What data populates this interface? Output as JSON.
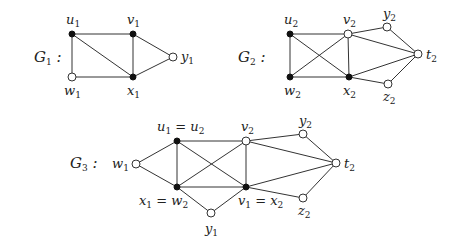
{
  "graphs": [
    {
      "name": "G1",
      "label": {
        "main": "G",
        "sub": "1",
        "suffix": " :",
        "x": 34,
        "y": 62
      },
      "vertices": [
        {
          "id": "u1",
          "x": 72,
          "y": 34,
          "filled": true,
          "label": {
            "main": "u",
            "sub": "1",
            "x": 66,
            "y": 24
          }
        },
        {
          "id": "v1",
          "x": 133,
          "y": 34,
          "filled": true,
          "label": {
            "main": "v",
            "sub": "1",
            "x": 127,
            "y": 24
          }
        },
        {
          "id": "y1",
          "x": 173,
          "y": 57,
          "filled": false,
          "label": {
            "main": "y",
            "sub": "1",
            "x": 181,
            "y": 61
          }
        },
        {
          "id": "w1",
          "x": 72,
          "y": 77,
          "filled": false,
          "label": {
            "main": "w",
            "sub": "1",
            "x": 64,
            "y": 95
          }
        },
        {
          "id": "x1",
          "x": 133,
          "y": 77,
          "filled": true,
          "label": {
            "main": "x",
            "sub": "1",
            "x": 127,
            "y": 95
          }
        }
      ],
      "edges": [
        [
          "u1",
          "v1"
        ],
        [
          "u1",
          "w1"
        ],
        [
          "u1",
          "x1"
        ],
        [
          "v1",
          "x1"
        ],
        [
          "v1",
          "y1"
        ],
        [
          "w1",
          "x1"
        ],
        [
          "x1",
          "y1"
        ]
      ]
    },
    {
      "name": "G2",
      "label": {
        "main": "G",
        "sub": "2",
        "suffix": " :",
        "x": 238,
        "y": 62
      },
      "vertices": [
        {
          "id": "u2",
          "x": 290,
          "y": 34,
          "filled": true,
          "label": {
            "main": "u",
            "sub": "2",
            "x": 284,
            "y": 24
          }
        },
        {
          "id": "v2",
          "x": 348,
          "y": 34,
          "filled": false,
          "label": {
            "main": "v",
            "sub": "2",
            "x": 343,
            "y": 24
          }
        },
        {
          "id": "y2",
          "x": 387,
          "y": 27,
          "filled": false,
          "label": {
            "main": "y",
            "sub": "2",
            "x": 383,
            "y": 18
          }
        },
        {
          "id": "t2",
          "x": 418,
          "y": 54,
          "filled": false,
          "label": {
            "main": "t",
            "sub": "2",
            "x": 426,
            "y": 59
          }
        },
        {
          "id": "w2",
          "x": 290,
          "y": 77,
          "filled": true,
          "label": {
            "main": "w",
            "sub": "2",
            "x": 284,
            "y": 95
          }
        },
        {
          "id": "x2",
          "x": 349,
          "y": 77,
          "filled": true,
          "label": {
            "main": "x",
            "sub": "2",
            "x": 343,
            "y": 95
          }
        },
        {
          "id": "z2",
          "x": 388,
          "y": 84,
          "filled": false,
          "label": {
            "main": "z",
            "sub": "2",
            "x": 383,
            "y": 101
          }
        }
      ],
      "edges": [
        [
          "u2",
          "v2"
        ],
        [
          "u2",
          "w2"
        ],
        [
          "u2",
          "x2"
        ],
        [
          "w2",
          "v2"
        ],
        [
          "w2",
          "x2"
        ],
        [
          "v2",
          "x2"
        ],
        [
          "v2",
          "y2"
        ],
        [
          "v2",
          "t2"
        ],
        [
          "y2",
          "t2"
        ],
        [
          "x2",
          "t2"
        ],
        [
          "x2",
          "z2"
        ],
        [
          "z2",
          "t2"
        ]
      ]
    },
    {
      "name": "G3",
      "label": {
        "main": "G",
        "sub": "3",
        "suffix": " :",
        "x": 70,
        "y": 168
      },
      "vertices": [
        {
          "id": "w1",
          "x": 136,
          "y": 164,
          "filled": false,
          "label": {
            "main": "w",
            "sub": "1",
            "x": 112,
            "y": 168
          }
        },
        {
          "id": "u1=u2",
          "x": 177,
          "y": 141,
          "filled": true,
          "label": {
            "main": "u",
            "sub": "1",
            "rest": " = u",
            "sub2": "2",
            "x": 157,
            "y": 131
          }
        },
        {
          "id": "v2",
          "x": 246,
          "y": 141,
          "filled": false,
          "label": {
            "main": "v",
            "sub": "2",
            "x": 241,
            "y": 131
          }
        },
        {
          "id": "y2",
          "x": 303,
          "y": 134,
          "filled": false,
          "label": {
            "main": "y",
            "sub": "2",
            "x": 299,
            "y": 125
          }
        },
        {
          "id": "t2",
          "x": 336,
          "y": 163,
          "filled": false,
          "label": {
            "main": "t",
            "sub": "2",
            "x": 344,
            "y": 168
          }
        },
        {
          "id": "x1=w2",
          "x": 177,
          "y": 187,
          "filled": true,
          "label": {
            "main": "x",
            "sub": "1",
            "rest": " = w",
            "sub2": "2",
            "x": 139,
            "y": 205
          }
        },
        {
          "id": "v1=x2",
          "x": 246,
          "y": 187,
          "filled": true,
          "label": {
            "main": "v",
            "sub": "1",
            "rest": " = x",
            "sub2": "2",
            "x": 238,
            "y": 205
          }
        },
        {
          "id": "z2",
          "x": 303,
          "y": 198,
          "filled": false,
          "label": {
            "main": "z",
            "sub": "2",
            "x": 298,
            "y": 215
          }
        },
        {
          "id": "y1",
          "x": 211,
          "y": 213,
          "filled": false,
          "label": {
            "main": "y",
            "sub": "1",
            "x": 205,
            "y": 233
          }
        }
      ],
      "edges": [
        [
          "w1",
          "u1=u2"
        ],
        [
          "w1",
          "x1=w2"
        ],
        [
          "u1=u2",
          "v2"
        ],
        [
          "u1=u2",
          "x1=w2"
        ],
        [
          "u1=u2",
          "v1=x2"
        ],
        [
          "x1=w2",
          "v2"
        ],
        [
          "x1=w2",
          "v1=x2"
        ],
        [
          "v2",
          "v1=x2"
        ],
        [
          "x1=w2",
          "y1"
        ],
        [
          "v1=x2",
          "y1"
        ],
        [
          "v2",
          "y2"
        ],
        [
          "v2",
          "t2"
        ],
        [
          "y2",
          "t2"
        ],
        [
          "v1=x2",
          "t2"
        ],
        [
          "v1=x2",
          "z2"
        ],
        [
          "z2",
          "t2"
        ]
      ]
    }
  ]
}
